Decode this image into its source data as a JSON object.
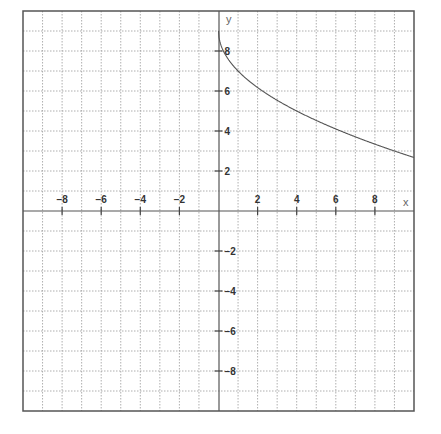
{
  "chart_data": {
    "type": "line",
    "title": "",
    "xlabel": "x",
    "ylabel": "y",
    "xlim": [
      -10,
      10
    ],
    "ylim": [
      -10,
      10
    ],
    "grid": true,
    "x_ticks": [
      -8,
      -6,
      -4,
      -2,
      2,
      4,
      6,
      8
    ],
    "y_ticks": [
      8,
      6,
      4,
      2,
      -2,
      -4,
      -6,
      -8
    ],
    "series": [
      {
        "name": "y = 9 - 2√x",
        "x": [
          0,
          0.25,
          1,
          2,
          3,
          4,
          5,
          6,
          7,
          8,
          9,
          10
        ],
        "y": [
          9,
          8,
          7,
          6.17,
          5.54,
          5,
          4.53,
          4.1,
          3.71,
          3.34,
          3,
          2.68
        ]
      }
    ]
  }
}
